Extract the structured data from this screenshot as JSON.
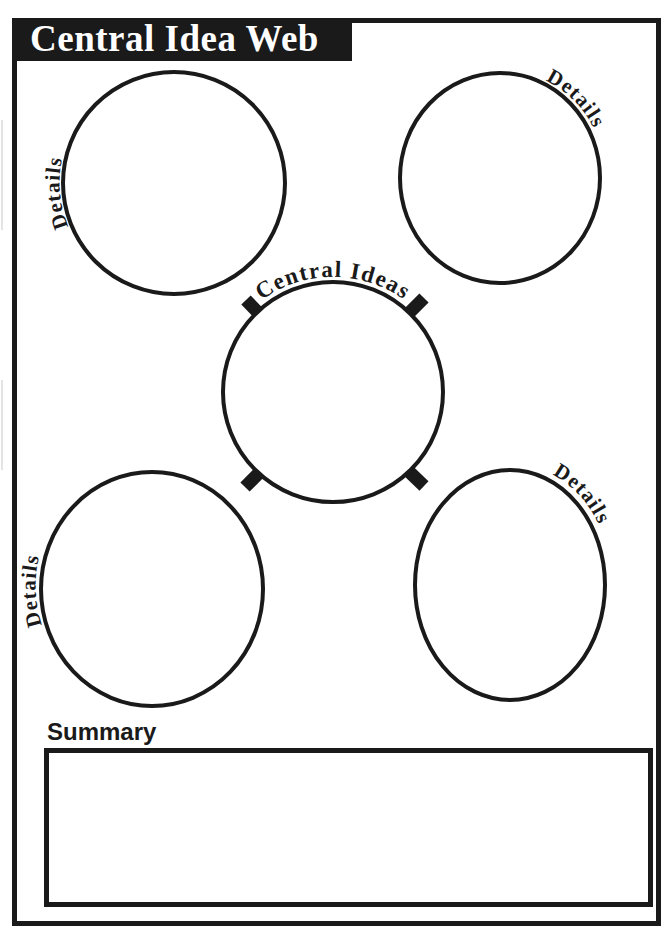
{
  "worksheet": {
    "title": "Central Idea Web",
    "center_bubble": {
      "label": "Central Ideas",
      "cx": 333,
      "cy": 392,
      "r": 110
    },
    "detail_bubbles": [
      {
        "label": "Details",
        "position": "top-left",
        "cx": 174,
        "cy": 183,
        "rx": 111,
        "ry": 111
      },
      {
        "label": "Details",
        "position": "top-right",
        "cx": 500,
        "cy": 178,
        "rx": 100,
        "ry": 105
      },
      {
        "label": "Details",
        "position": "bottom-left",
        "cx": 152,
        "cy": 589,
        "rx": 111,
        "ry": 117
      },
      {
        "label": "Details",
        "position": "bottom-right",
        "cx": 510,
        "cy": 585,
        "rx": 95,
        "ry": 115
      }
    ],
    "summary": {
      "label": "Summary",
      "value": "",
      "placeholder": ""
    },
    "colors": {
      "ink": "#1a1a1a",
      "paper": "#ffffff",
      "banner_background": "#1a1a1a",
      "banner_text": "#ffffff"
    }
  }
}
